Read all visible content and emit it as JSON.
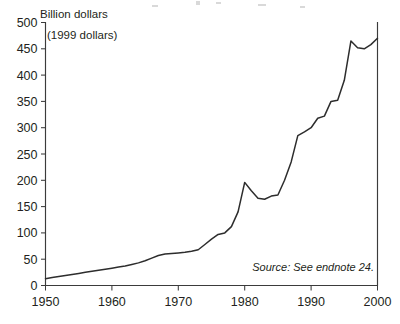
{
  "chart_data": {
    "type": "line",
    "title": "",
    "xlabel": "",
    "ylabel": "Billion dollars",
    "unit_note": "(1999 dollars)",
    "source_note": "Source: See endnote 24.",
    "xlim": [
      1950,
      2000
    ],
    "ylim": [
      0,
      500
    ],
    "grid": false,
    "legend": "none",
    "xticks": [
      1950,
      1960,
      1970,
      1980,
      1990,
      2000
    ],
    "xtick_labels": [
      "1950",
      "1960",
      "1970",
      "1980",
      "1990",
      "2000"
    ],
    "yticks": [
      0,
      50,
      100,
      150,
      200,
      250,
      300,
      350,
      400,
      450,
      500
    ],
    "ytick_labels": [
      "0",
      "50",
      "100",
      "150",
      "200",
      "250",
      "300",
      "350",
      "400",
      "450",
      "500"
    ],
    "series": [
      {
        "name": "Expenditure",
        "x": [
          1950,
          1951,
          1952,
          1953,
          1954,
          1955,
          1956,
          1957,
          1958,
          1959,
          1960,
          1961,
          1962,
          1963,
          1964,
          1965,
          1966,
          1967,
          1968,
          1969,
          1970,
          1971,
          1972,
          1973,
          1974,
          1975,
          1976,
          1977,
          1978,
          1979,
          1980,
          1981,
          1982,
          1983,
          1984,
          1985,
          1986,
          1987,
          1988,
          1989,
          1990,
          1991,
          1992,
          1993,
          1994,
          1995,
          1996,
          1997,
          1998,
          1999,
          2000
        ],
        "values": [
          13,
          15,
          17,
          19,
          21,
          23,
          25,
          27,
          29,
          31,
          33,
          35,
          37,
          40,
          43,
          47,
          52,
          57,
          60,
          61,
          62,
          63,
          65,
          68,
          78,
          88,
          97,
          100,
          112,
          140,
          196,
          180,
          166,
          164,
          170,
          172,
          200,
          235,
          285,
          292,
          300,
          318,
          322,
          350,
          352,
          390,
          465,
          452,
          450,
          458,
          470
        ]
      }
    ]
  },
  "figure": {
    "alt_name": "line-chart"
  }
}
